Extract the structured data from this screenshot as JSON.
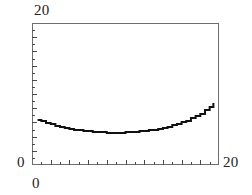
{
  "figure": {
    "title": "",
    "background_color": "#ffffff",
    "frame_color": "#6e6e6e",
    "curve_color": "#111111"
  },
  "labels": {
    "y_axis_top": "20",
    "y_axis_zero": "0",
    "x_axis_zero": "0",
    "x_axis_max": "20"
  },
  "chart_data": {
    "type": "line",
    "title": "",
    "subtitle": "",
    "xlabel": "",
    "ylabel": "",
    "xlim": [
      0,
      20
    ],
    "ylim": [
      0,
      20
    ],
    "xticks": [
      0,
      1,
      2,
      3,
      4,
      5,
      6,
      7,
      8,
      9,
      10,
      11,
      12,
      13,
      14,
      15,
      16,
      17,
      18,
      19,
      20
    ],
    "yticks": [
      0,
      1,
      2,
      3,
      4,
      5,
      6,
      7,
      8,
      9,
      10,
      11,
      12,
      13,
      14,
      15,
      16,
      17,
      18,
      19,
      20
    ],
    "xtick_labels": [
      "0",
      "",
      "",
      "",
      "",
      "",
      "",
      "",
      "",
      "",
      "",
      "",
      "",
      "",
      "",
      "",
      "",
      "",
      "",
      "",
      "20"
    ],
    "ytick_labels": [
      "0",
      "",
      "",
      "",
      "",
      "",
      "",
      "",
      "",
      "",
      "",
      "",
      "",
      "",
      "",
      "",
      "",
      "",
      "",
      "",
      "20"
    ],
    "tick_direction": "in",
    "grid": false,
    "legend": null,
    "legend_position": "none",
    "annotations": [],
    "series": [
      {
        "name": "curve",
        "style": "solid",
        "linewidth": 2,
        "color": "#111111",
        "x": [
          0.6,
          1.0,
          1.5,
          2.0,
          2.5,
          3.0,
          3.5,
          4.0,
          4.5,
          5.0,
          5.5,
          6.0,
          6.5,
          7.0,
          7.5,
          8.0,
          8.5,
          9.0,
          9.5,
          10.0,
          10.5,
          11.0,
          11.5,
          12.0,
          12.5,
          13.0,
          13.5,
          14.0,
          14.5,
          15.0,
          15.5,
          16.0,
          16.5,
          17.0,
          17.5,
          18.0,
          18.5,
          19.0,
          19.4
        ],
        "y": [
          6.35,
          6.15,
          5.92,
          5.72,
          5.54,
          5.38,
          5.23,
          5.1,
          4.99,
          4.89,
          4.8,
          4.73,
          4.67,
          4.62,
          4.59,
          4.57,
          4.56,
          4.56,
          4.57,
          4.59,
          4.62,
          4.67,
          4.72,
          4.79,
          4.88,
          4.98,
          5.1,
          5.24,
          5.4,
          5.58,
          5.78,
          6.0,
          6.26,
          6.55,
          6.88,
          7.25,
          7.68,
          8.2,
          8.72
        ]
      }
    ]
  }
}
